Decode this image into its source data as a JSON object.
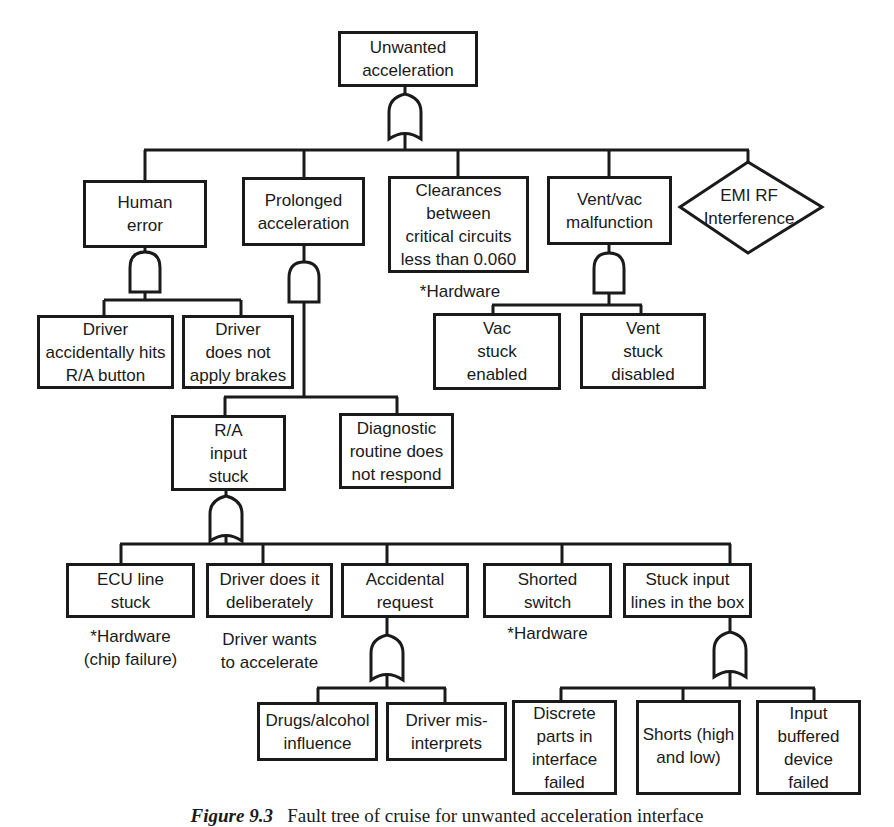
{
  "diagram": {
    "type": "fault-tree",
    "top_event": {
      "label": "Unwanted\nacceleration",
      "gate": "OR"
    },
    "level1": [
      {
        "id": "human_error",
        "label": "Human\nerror",
        "gate": "AND",
        "children": [
          {
            "label": "Driver\naccidentally hits\nR/A button"
          },
          {
            "label": "Driver\ndoes not\napply brakes"
          }
        ]
      },
      {
        "id": "prolonged",
        "label": "Prolonged\nacceleration",
        "gate": "AND",
        "children": [
          {
            "id": "ra_stuck",
            "label": "R/A\ninput\nstuck",
            "gate": "OR"
          },
          {
            "label": "Diagnostic\nroutine does\nnot respond"
          }
        ]
      },
      {
        "id": "clearances",
        "label": "Clearances\nbetween\ncritical circuits\nless than 0.060",
        "note": "*Hardware"
      },
      {
        "id": "ventvac",
        "label": "Vent/vac\nmalfunction",
        "gate": "AND",
        "children": [
          {
            "label": "Vac\nstuck\nenabled"
          },
          {
            "label": "Vent\nstuck\ndisabled"
          }
        ]
      },
      {
        "id": "emi",
        "label": "EMI RF\nInterference",
        "shape": "diamond"
      }
    ],
    "ra_stuck_children": [
      {
        "label": "ECU line\nstuck",
        "note": "*Hardware\n(chip failure)"
      },
      {
        "label": "Driver does it\ndeliberately",
        "note": "Driver wants\nto accelerate"
      },
      {
        "label": "Accidental\nrequest",
        "gate": "OR",
        "children": [
          {
            "label": "Drugs/alcohol\ninfluence"
          },
          {
            "label": "Driver mis-\ninterprets"
          }
        ]
      },
      {
        "label": "Shorted\nswitch",
        "note": "*Hardware"
      },
      {
        "label": "Stuck input\nlines in the box",
        "gate": "OR",
        "children": [
          {
            "label": "Discrete\nparts in\ninterface\nfailed"
          },
          {
            "label": "Shorts (high\nand low)"
          },
          {
            "label": "Input\nbuffered\ndevice\nfailed"
          }
        ]
      }
    ],
    "caption": {
      "figure": "Figure 9.3",
      "text": "Fault tree of cruise for unwanted acceleration interface"
    }
  }
}
